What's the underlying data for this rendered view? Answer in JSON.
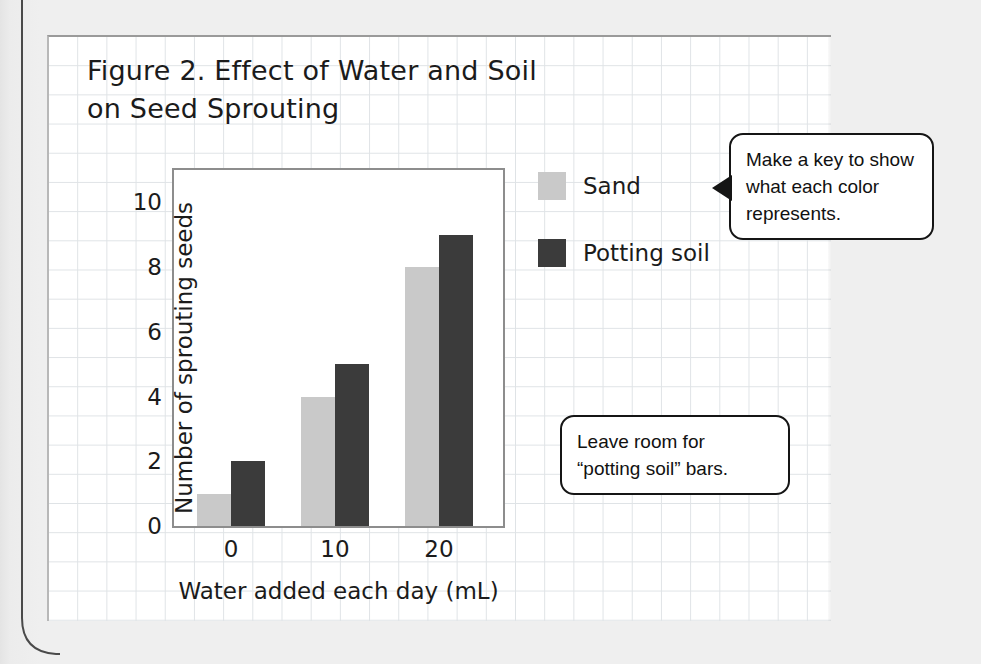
{
  "figure": {
    "title": "Figure 2. Effect of Water and Soil on Seed Sprouting"
  },
  "chart_data": {
    "type": "bar",
    "title": "Figure 2. Effect of Water and Soil on Seed Sprouting",
    "xlabel": "Water added each day (mL)",
    "ylabel": "Number of sprouting seeds",
    "categories": [
      "0",
      "10",
      "20"
    ],
    "series": [
      {
        "name": "Sand",
        "color": "#c9c9c9",
        "values": [
          1,
          4,
          8
        ]
      },
      {
        "name": "Potting soil",
        "color": "#3b3b3b",
        "values": [
          2,
          5,
          9
        ]
      }
    ],
    "ylim": [
      0,
      11
    ],
    "yticks": [
      0,
      2,
      4,
      6,
      8,
      10
    ],
    "ytick_labels": [
      "0",
      "2",
      "4",
      "6",
      "8",
      "10"
    ],
    "xtick_labels": [
      "0",
      "10",
      "20"
    ],
    "grid": false,
    "legend_position": "right"
  },
  "legend": {
    "items": [
      {
        "label": "Sand",
        "color": "#c9c9c9"
      },
      {
        "label": "Potting soil",
        "color": "#3b3b3b"
      }
    ]
  },
  "callouts": [
    {
      "id": "key",
      "text": "Make a key to show what each color represents."
    },
    {
      "id": "room",
      "text": "Leave room for “potting soil” bars."
    }
  ]
}
